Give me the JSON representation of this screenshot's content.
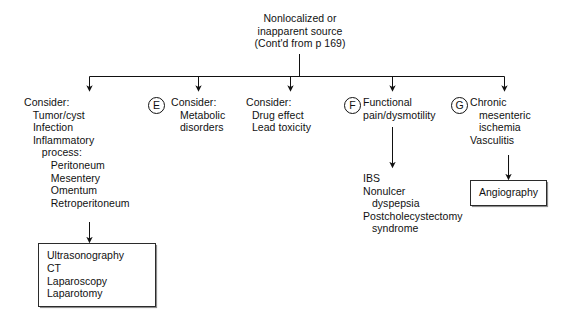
{
  "diagram": {
    "type": "clinical-algorithm-flowchart",
    "root": {
      "lines": [
        "Nonlocalized or",
        "inapparent source",
        "(Cont'd from p 169)"
      ]
    },
    "branches": [
      {
        "id": "branch-1",
        "marker": "",
        "lines": [
          "Consider:",
          "   Tumor/cyst",
          "   Infection",
          "   Inflammatory",
          "      process:",
          "         Peritoneum",
          "         Mesentery",
          "         Omentum",
          "         Retroperitoneum"
        ],
        "outcome": {
          "id": "box-imaging",
          "lines": [
            "Ultrasonography",
            "CT",
            "Laparoscopy",
            "Laparotomy"
          ]
        }
      },
      {
        "id": "branch-2",
        "marker": "E",
        "lines": [
          "Consider:",
          "   Metabolic",
          "   disorders"
        ]
      },
      {
        "id": "branch-3",
        "marker": "",
        "lines": [
          "Consider:",
          "  Drug effect",
          "  Lead toxicity"
        ]
      },
      {
        "id": "branch-4",
        "marker": "F",
        "lines": [
          "Functional",
          "pain/dysmotility"
        ],
        "sub_lines": [
          "IBS",
          "Nonulcer",
          "   dyspepsia",
          "Postcholecystectomy",
          "   syndrome"
        ]
      },
      {
        "id": "branch-5",
        "marker": "G",
        "lines": [
          "Chronic",
          "   mesenteric",
          "   ischemia",
          "Vasculitis"
        ],
        "outcome": {
          "id": "box-angio",
          "lines": [
            "Angiography"
          ]
        }
      }
    ],
    "colors": {
      "ink": "#111111",
      "rule": "#2b2b2b",
      "shadow": "#8e8e8e",
      "background": "#ffffff"
    }
  }
}
